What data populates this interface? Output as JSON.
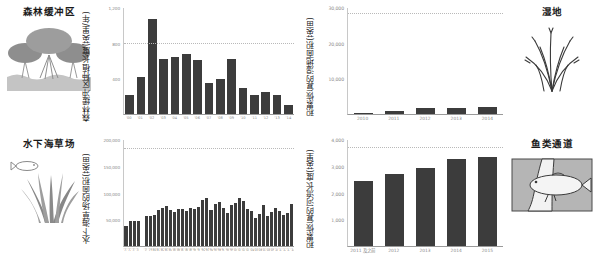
{
  "panels": {
    "forest_buffer": {
      "illustration_title": "森林缓冲区",
      "icon": "forest-trees-icon",
      "axis_title": "森林缓冲区种植长度(英里/年)",
      "chart_data": {
        "type": "bar",
        "title": "森林缓冲区种植长度",
        "xlabel": "",
        "ylabel": "森林缓冲区种植长度(英里/年)",
        "ylim": [
          0,
          1200
        ],
        "grid": true,
        "yticks": [
          0,
          400,
          800,
          1200
        ],
        "ytick_labels": [
          "0",
          "400",
          "800",
          "1,200"
        ],
        "gridline_value": 800,
        "categories": [
          "'00",
          "'01",
          "'02",
          "'03",
          "'04",
          "'05",
          "'06",
          "'07",
          "'08",
          "'09",
          "'10",
          "'11",
          "'12",
          "'13",
          "'14"
        ],
        "values": [
          210,
          420,
          1075,
          620,
          645,
          680,
          615,
          350,
          400,
          620,
          290,
          215,
          245,
          210,
          105
        ]
      }
    },
    "seagrass": {
      "illustration_title": "水下海草场",
      "icon": "seagrass-fish-icon",
      "axis_title": "水下海草场的面积(英亩)",
      "chart_data": {
        "type": "bar",
        "title": "水下海草场的面积",
        "xlabel": "",
        "ylabel": "水下海草场的面积(英亩)",
        "ylim": [
          0,
          200000
        ],
        "grid": true,
        "yticks": [
          0,
          50000,
          100000,
          150000,
          200000
        ],
        "ytick_labels": [
          "0",
          "50,000",
          "100,000",
          "150,000",
          "200,000"
        ],
        "gridline_value": 185000,
        "categories": [
          "'71",
          "'72",
          "'73",
          "'74",
          "",
          "'78",
          "'79",
          "'80",
          "'81",
          "'82",
          "'83",
          "'84",
          "'85",
          "'86",
          "'87",
          "'88",
          "'89",
          "'90",
          "'91",
          "'92",
          "'93",
          "'94",
          "'95",
          "'96",
          "'97",
          "'98",
          "'99",
          "'00",
          "'01",
          "'02",
          "'03",
          "'04",
          "'05",
          "'06",
          "'07",
          "'08",
          "'09",
          "'10",
          "'11",
          "'12",
          "'13",
          "'14"
        ],
        "values": [
          38000,
          47000,
          48000,
          47000,
          null,
          57000,
          56000,
          58000,
          68000,
          71000,
          76000,
          68000,
          64000,
          70000,
          69000,
          66000,
          72000,
          70000,
          73000,
          86000,
          91000,
          68000,
          79000,
          83000,
          72000,
          63000,
          78000,
          82000,
          90000,
          84000,
          69000,
          66000,
          52000,
          61000,
          78000,
          57000,
          64000,
          72000,
          66000,
          58000,
          63000,
          80000
        ]
      }
    },
    "wetland": {
      "illustration_title": "湿地",
      "icon": "wetland-grass-icon",
      "axis_title": "积累恢复的湿地面积(英亩)",
      "chart_data": {
        "type": "bar",
        "title": "积累恢复的湿地面积",
        "xlabel": "",
        "ylabel": "积累恢复的湿地面积(英亩)",
        "ylim": [
          0,
          30000
        ],
        "grid": true,
        "yticks": [
          0,
          10000,
          20000,
          30000
        ],
        "ytick_labels": [
          "0",
          "10,000",
          "20,000",
          "30,000"
        ],
        "gridline_value": 28500,
        "categories": [
          "2010",
          "2011",
          "2012",
          "2013",
          "2014"
        ],
        "values": [
          420,
          900,
          1750,
          1800,
          1850
        ]
      }
    },
    "fish_passage": {
      "illustration_title": "鱼类通道",
      "icon": "fish-culvert-icon",
      "axis_title": "积累恢复的河流长度(英里)",
      "chart_data": {
        "type": "bar",
        "title": "积累恢复的河流长度",
        "xlabel": "",
        "ylabel": "积累恢复的河流长度(英里)",
        "ylim": [
          0,
          4000
        ],
        "grid": true,
        "yticks": [
          0,
          1000,
          2000,
          3000,
          4000
        ],
        "ytick_labels": [
          "0",
          "1,000",
          "2,000",
          "3,000",
          "4,000"
        ],
        "gridline_value": 3750,
        "categories": [
          "2011 及之前",
          "2012",
          "2013",
          "2014",
          "2015"
        ],
        "values": [
          2450,
          2700,
          2950,
          3300,
          3350
        ]
      }
    }
  },
  "colors": {
    "bar": "#3c3c3c",
    "grid": "#b9b9b9",
    "axis": "#9a9a9a",
    "tick_text": "#8a8a8a",
    "title_text": "#1a1a1a",
    "illo_fill": "#9a9a9a",
    "illo_fill_dark": "#7d7d7d",
    "illo_panel": "#b5b5b5"
  }
}
